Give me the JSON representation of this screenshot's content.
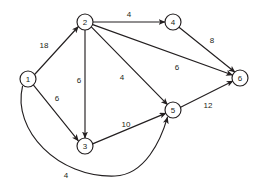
{
  "figure": {
    "background_color": "#ffffff",
    "stroke_color": "#231f20",
    "node_fill": "#ffffff"
  },
  "nodes": [
    {
      "id": "1",
      "label": "1",
      "cx": 28,
      "cy": 79,
      "r": 8
    },
    {
      "id": "2",
      "label": "2",
      "cx": 85,
      "cy": 22,
      "r": 8
    },
    {
      "id": "3",
      "label": "3",
      "cx": 85,
      "cy": 146,
      "r": 8
    },
    {
      "id": "4",
      "label": "4",
      "cx": 173,
      "cy": 22,
      "r": 8
    },
    {
      "id": "5",
      "label": "5",
      "cx": 173,
      "cy": 110,
      "r": 8
    },
    {
      "id": "6",
      "label": "6",
      "cx": 240,
      "cy": 78,
      "r": 8
    }
  ],
  "edges": [
    {
      "id": "e-1-2",
      "from": "1",
      "to": "2",
      "weight": "18",
      "label_x": 44,
      "label_y": 45,
      "path": "M 34.6 74.5 L 78.4 26.5",
      "curved": false
    },
    {
      "id": "e-1-3",
      "from": "1",
      "to": "3",
      "weight": "6",
      "label_x": 57,
      "label_y": 98,
      "path": "M 33.5 85.2 L 78.4 140.8",
      "curved": false
    },
    {
      "id": "e-1-5",
      "from": "1",
      "to": "5",
      "weight": "4",
      "label_x": 66,
      "label_y": 175,
      "path": "M 22.5 86.4 C 12 130 58 178 115 176 C 145 175 161 140 167.5 117.2",
      "curved": true
    },
    {
      "id": "e-2-3",
      "from": "2",
      "to": "3",
      "weight": "6",
      "label_x": 79,
      "label_y": 80,
      "path": "M 85 30 L 85 138",
      "curved": false
    },
    {
      "id": "e-2-4",
      "from": "2",
      "to": "4",
      "weight": "4",
      "label_x": 129,
      "label_y": 14,
      "path": "M 93 22 L 165 22",
      "curved": false
    },
    {
      "id": "e-2-5",
      "from": "2",
      "to": "5",
      "weight": "4",
      "label_x": 122,
      "label_y": 77,
      "path": "M 91.3 26.9 L 167.5 104.7",
      "curved": false
    },
    {
      "id": "e-2-6",
      "from": "2",
      "to": "6",
      "weight": "6",
      "label_x": 177,
      "label_y": 67,
      "path": "M 92.8 24.6 L 232.5 75.0",
      "curved": false
    },
    {
      "id": "e-3-5",
      "from": "3",
      "to": "5",
      "weight": "10",
      "label_x": 126,
      "label_y": 124,
      "path": "M 92.6 143.9 L 166.0 113.1",
      "curved": false
    },
    {
      "id": "e-4-6",
      "from": "4",
      "to": "6",
      "weight": "8",
      "label_x": 212,
      "label_y": 40,
      "path": "M 179.0 27.3 L 235.0 72.3",
      "curved": false
    },
    {
      "id": "e-5-6",
      "from": "5",
      "to": "6",
      "weight": "12",
      "label_x": 208,
      "label_y": 105,
      "path": "M 180.6 107.2 L 233.0 81.0",
      "curved": false
    }
  ]
}
